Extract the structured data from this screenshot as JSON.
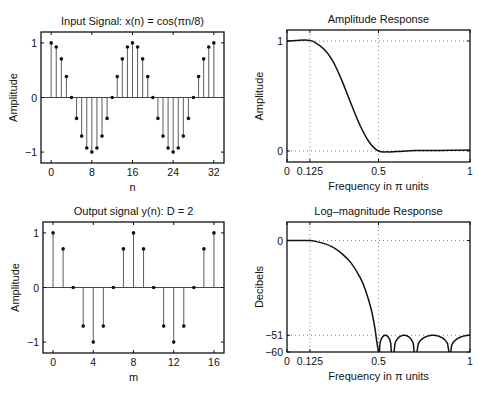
{
  "figure": {
    "background": "#ffffff",
    "ink": "#111111"
  },
  "chart_data": [
    {
      "id": "input",
      "type": "stem",
      "title": "Input Signal: x(n) = cos(πn/8)",
      "xlabel": "n",
      "ylabel": "Amplitude",
      "xlim": [
        -2,
        34
      ],
      "ylim": [
        -1.2,
        1.2
      ],
      "xticks": [
        0,
        8,
        16,
        24,
        32
      ],
      "yticks": [
        -1,
        0,
        1
      ],
      "ytick_labels": [
        "−1",
        "0",
        "1"
      ],
      "grid": false,
      "x": [
        0,
        1,
        2,
        3,
        4,
        5,
        6,
        7,
        8,
        9,
        10,
        11,
        12,
        13,
        14,
        15,
        16,
        17,
        18,
        19,
        20,
        21,
        22,
        23,
        24,
        25,
        26,
        27,
        28,
        29,
        30,
        31,
        32
      ],
      "y": [
        1,
        0.924,
        0.707,
        0.383,
        0,
        -0.383,
        -0.707,
        -0.924,
        -1,
        -0.924,
        -0.707,
        -0.383,
        0,
        0.383,
        0.707,
        0.924,
        1,
        0.924,
        0.707,
        0.383,
        0,
        -0.383,
        -0.707,
        -0.924,
        -1,
        -0.924,
        -0.707,
        -0.383,
        0,
        0.383,
        0.707,
        0.924,
        1
      ],
      "box": {
        "left": 41,
        "top": 32,
        "right": 224,
        "bottom": 163
      }
    },
    {
      "id": "amplitude",
      "type": "line",
      "title": "Amplitude Response",
      "xlabel": "Frequency in π units",
      "ylabel": "Amplitude",
      "xlim": [
        0,
        1
      ],
      "ylim": [
        -0.1,
        1.1
      ],
      "xticks": [
        0,
        0.125,
        0.5,
        1
      ],
      "xtick_labels": [
        "0",
        "0.125",
        "0.5",
        "1"
      ],
      "yticks": [
        0,
        1
      ],
      "ytick_labels": [
        "0",
        "1"
      ],
      "grid_x": [
        0.125,
        0.5
      ],
      "grid_y": [
        0,
        1
      ],
      "x": [
        0,
        0.05,
        0.1,
        0.125,
        0.15,
        0.2,
        0.25,
        0.3,
        0.35,
        0.4,
        0.45,
        0.5,
        0.55,
        0.6,
        0.7,
        0.8,
        0.9,
        1.0
      ],
      "y": [
        1.0,
        1.005,
        1.01,
        1.005,
        0.99,
        0.93,
        0.82,
        0.64,
        0.43,
        0.23,
        0.08,
        0.0,
        -0.008,
        -0.005,
        0.004,
        0.005,
        0.006,
        0.008
      ],
      "box": {
        "left": 287,
        "top": 30,
        "right": 470,
        "bottom": 162
      }
    },
    {
      "id": "output",
      "type": "stem",
      "title": "Output signal y(n): D = 2",
      "xlabel": "m",
      "ylabel": "Amplitude",
      "xlim": [
        -1,
        17
      ],
      "ylim": [
        -1.2,
        1.2
      ],
      "xticks": [
        0,
        4,
        8,
        12,
        16
      ],
      "yticks": [
        -1,
        0,
        1
      ],
      "ytick_labels": [
        "−1",
        "0",
        "1"
      ],
      "grid": false,
      "x": [
        0,
        1,
        2,
        3,
        4,
        5,
        6,
        7,
        8,
        9,
        10,
        11,
        12,
        13,
        14,
        15,
        16
      ],
      "y": [
        1,
        0.707,
        0,
        -0.707,
        -1,
        -0.707,
        0,
        0.707,
        1,
        0.707,
        0,
        -0.707,
        -1,
        -0.707,
        0,
        0.707,
        1
      ],
      "box": {
        "left": 43,
        "top": 222,
        "right": 224,
        "bottom": 353
      }
    },
    {
      "id": "logmag",
      "type": "line",
      "title": "Log–magnitude Response",
      "xlabel": "Frequency in π units",
      "ylabel": "Decibels",
      "xlim": [
        0,
        1
      ],
      "ylim": [
        -60,
        10
      ],
      "xticks": [
        0,
        0.125,
        0.5,
        1
      ],
      "xtick_labels": [
        "0",
        "0.125",
        "0.5",
        "1"
      ],
      "yticks": [
        -60,
        -51,
        0
      ],
      "ytick_labels": [
        "−60",
        "−51",
        "0"
      ],
      "grid_x": [
        0.125,
        0.5
      ],
      "grid_y": [
        0,
        -51
      ],
      "x": [
        0,
        0.05,
        0.1,
        0.125,
        0.15,
        0.2,
        0.25,
        0.3,
        0.35,
        0.4,
        0.43,
        0.46,
        0.48,
        0.49,
        0.5
      ],
      "y": [
        0,
        0,
        0,
        0,
        -0.3,
        -1.5,
        -3.5,
        -7,
        -12,
        -20,
        -27,
        -37,
        -47,
        -54,
        -60
      ],
      "stopband_lobes": [
        {
          "start": 0.505,
          "end": 0.57,
          "peak": -51
        },
        {
          "start": 0.585,
          "end": 0.695,
          "peak": -51
        },
        {
          "start": 0.71,
          "end": 0.885,
          "peak": -51
        },
        {
          "start": 0.895,
          "end": 1.0,
          "peak": -51,
          "partial": true
        }
      ],
      "box": {
        "left": 287,
        "top": 222,
        "right": 470,
        "bottom": 352
      }
    }
  ]
}
